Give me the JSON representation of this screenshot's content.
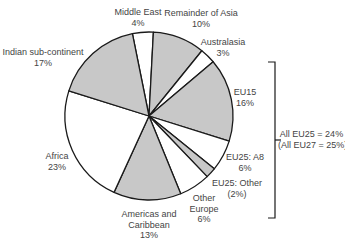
{
  "chart_data": {
    "type": "pie",
    "title": "",
    "start_angle_deg": -11.4,
    "direction": "clockwise",
    "center": [
      149,
      116
    ],
    "radius": 84,
    "colors": {
      "shaded": "#c8c8c8",
      "unshaded": "#ffffff",
      "stroke": "#1a1a1a"
    },
    "slices": [
      {
        "name": "Middle East",
        "value": 4,
        "label": "4%",
        "fill": "unshaded"
      },
      {
        "name": "Remainder of Asia",
        "value": 10,
        "label": "10%",
        "fill": "shaded"
      },
      {
        "name": "Australasia",
        "value": 3,
        "label": "3%",
        "fill": "unshaded"
      },
      {
        "name": "EU15",
        "value": 16,
        "label": "16%",
        "fill": "shaded"
      },
      {
        "name": "EU25: A8",
        "value": 6,
        "label": "6%",
        "fill": "unshaded"
      },
      {
        "name": "EU25: Other",
        "value": 2,
        "label": "(2%)",
        "fill": "shaded"
      },
      {
        "name": "Other Europe",
        "value": 6,
        "label": "6%",
        "fill": "unshaded"
      },
      {
        "name": "Americas and Caribbean",
        "value": 13,
        "label": "13%",
        "fill": "shaded"
      },
      {
        "name": "Africa",
        "value": 23,
        "label": "23%",
        "fill": "unshaded"
      },
      {
        "name": "Indian sub-continent",
        "value": 17,
        "label": "17%",
        "fill": "shaded"
      }
    ],
    "annotation": {
      "line1": "All EU25 = 24%",
      "line2": "(All EU27 = 25%)",
      "covers": [
        "EU15",
        "EU25: A8",
        "EU25: Other"
      ]
    }
  },
  "labels": [
    {
      "l1": "Middle East",
      "l2": "4%",
      "x": 138,
      "y": 7
    },
    {
      "l1": "Remainder of Asia",
      "l2": "10%",
      "x": 201,
      "y": 8
    },
    {
      "l1": "Australasia",
      "l2": "3%",
      "x": 223,
      "y": 37
    },
    {
      "l1": "EU15",
      "l2": "16%",
      "x": 245,
      "y": 87
    },
    {
      "l1": "EU25: A8",
      "l2": "6%",
      "x": 245,
      "y": 152
    },
    {
      "l1": "EU25: Other",
      "l2": "(2%)",
      "x": 237,
      "y": 178
    },
    {
      "l1": "Other",
      "l2": "Europe",
      "l3": "6%",
      "x": 204,
      "y": 193
    },
    {
      "l1": "Americas and",
      "l2": "Caribbean",
      "l3": "13%",
      "x": 149,
      "y": 209
    },
    {
      "l1": "Africa",
      "l2": "23%",
      "x": 57,
      "y": 151
    },
    {
      "l1": "Indian sub-continent",
      "l2": "17%",
      "x": 43,
      "y": 47
    }
  ]
}
